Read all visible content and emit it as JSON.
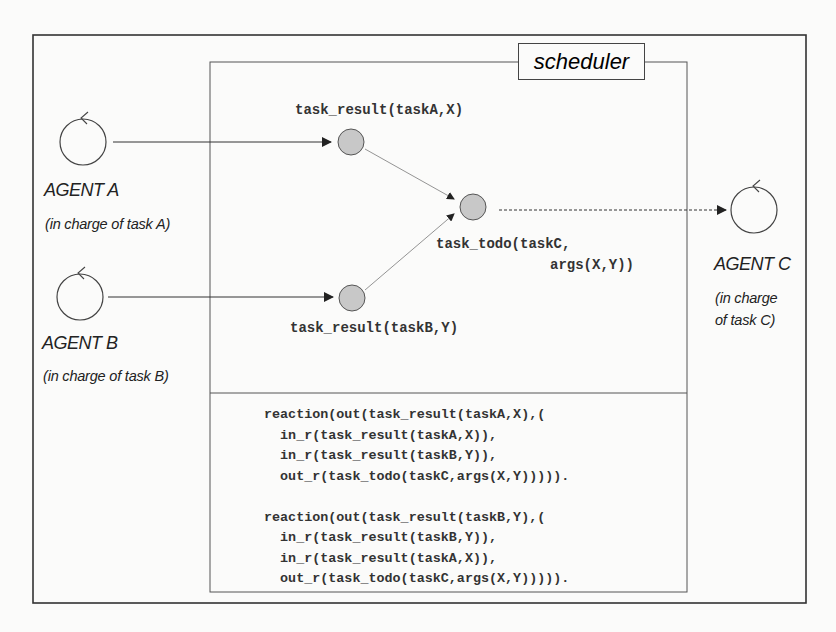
{
  "scheduler": {
    "title": "scheduler"
  },
  "agents": [
    {
      "name": "AGENT A",
      "description": "(in charge of task A)"
    },
    {
      "name": "AGENT B",
      "description": "(in charge of task B)"
    },
    {
      "name": "AGENT C",
      "description_line1": "(in charge",
      "description_line2": "of task C)"
    }
  ],
  "nodes": {
    "task_result_a": "task_result(taskA,X)",
    "task_result_b": "task_result(taskB,Y)",
    "task_todo_line1": "task_todo(taskC,",
    "task_todo_line2": "args(X,Y))"
  },
  "reactions": [
    {
      "lines": [
        "reaction(out(task_result(taskA,X),(",
        "  in_r(task_result(taskA,X)),",
        "  in_r(task_result(taskB,Y)),",
        "  out_r(task_todo(taskC,args(X,Y))))).",
        ""
      ]
    },
    {
      "lines": [
        "reaction(out(task_result(taskB,Y),(",
        "  in_r(task_result(taskB,Y)),",
        "  in_r(task_result(taskA,X)),",
        "  out_r(task_todo(taskC,args(X,Y)))))."
      ]
    }
  ],
  "colors": {
    "node_fill": "#c8c8c8",
    "stroke": "#444444",
    "background": "#fbfbfa"
  }
}
